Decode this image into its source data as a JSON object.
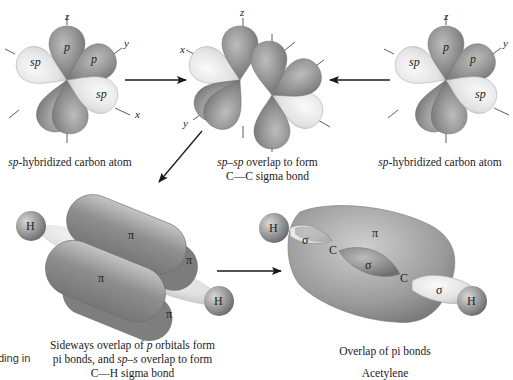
{
  "atoms": {
    "left": {
      "axis_labels": {
        "z": "z",
        "y": "y",
        "x": "x"
      },
      "lobe_labels": [
        "sp",
        "p",
        "p",
        "sp"
      ],
      "caption_em": "sp",
      "caption_rest": "-hybridized carbon atom"
    },
    "middle": {
      "axis_labels": {
        "z": "z",
        "x": "x",
        "y": "y"
      },
      "caption_line1_em1": "sp",
      "caption_line1_dash": "–",
      "caption_line1_em2": "sp",
      "caption_line1_rest": " overlap to form",
      "caption_line2": "C—C sigma bond"
    },
    "right": {
      "axis_labels": {
        "z": "z",
        "y": "y"
      },
      "lobe_labels": [
        "sp",
        "p",
        "p",
        "sp"
      ],
      "caption_em": "sp",
      "caption_rest": "-hybridized carbon atom"
    }
  },
  "molecules": {
    "pi_overlap": {
      "atom_labels": [
        "H",
        "H"
      ],
      "pi_labels": [
        "π",
        "π",
        "π",
        "π"
      ],
      "caption_line1_pre": "Sideways overlap of ",
      "caption_line1_em": "p",
      "caption_line1_post": " orbitals form",
      "caption_line2_pre": "pi bonds, and ",
      "caption_line2_em": "sp–s",
      "caption_line2_post": " overlap to form",
      "caption_line3": "C—H sigma bond"
    },
    "acetylene": {
      "atom_labels": [
        "H",
        "C",
        "C",
        "H"
      ],
      "sigma_labels": [
        "σ",
        "σ",
        "σ"
      ],
      "pi_label": "π",
      "caption": "Overlap of pi bonds",
      "caption_cut": "Acetylene"
    }
  },
  "edge_text": {
    "left_cut": "ding in"
  },
  "colors": {
    "p_lobe": "#8e8e8e",
    "p_lobe_light": "#b8b8b8",
    "sp_lobe": "#e6e6e6",
    "sp_lobe_light": "#f6f6f6",
    "arrow": "#1a1a1a",
    "text": "#222222"
  }
}
